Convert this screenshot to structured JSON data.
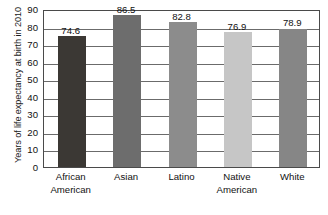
{
  "chart_data": {
    "type": "bar",
    "title": "",
    "subtitle": "",
    "xlabel": "",
    "ylabel": "Years of life expectancy at birth in 2010",
    "ylim": [
      0,
      90
    ],
    "ytick_step": 10,
    "yticks": [
      90,
      80,
      70,
      60,
      50,
      40,
      30,
      20,
      10,
      0
    ],
    "ytick_labels": [
      "90",
      "80",
      "70",
      "60",
      "50",
      "40",
      "30",
      "20",
      "10",
      "0"
    ],
    "grid": "horizontal",
    "legend": "none",
    "categories": [
      "African American",
      "Asian",
      "Latino",
      "Native American",
      "White"
    ],
    "category_lines": [
      [
        "African",
        "American"
      ],
      [
        "Asian"
      ],
      [
        "Latino"
      ],
      [
        "Native",
        "American"
      ],
      [
        "White"
      ]
    ],
    "values": [
      74.6,
      86.5,
      82.8,
      76.9,
      78.9
    ],
    "value_labels": [
      "74.6",
      "86.5",
      "82.8",
      "76.9",
      "78.9"
    ],
    "bar_colors": [
      "#3b3834",
      "#6d6d6d",
      "#8c8c8c",
      "#c6c6c6",
      "#868686"
    ],
    "axis_color": "#4a4a4a",
    "grid_color": "#6b6b6b",
    "background_color": "#ffffff",
    "text_color": "#111111"
  }
}
